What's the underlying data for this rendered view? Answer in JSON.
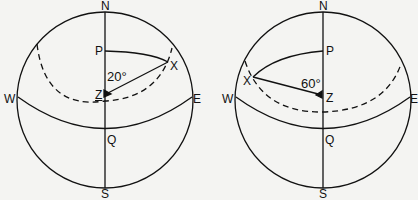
{
  "diagrams": [
    {
      "id": "left",
      "labels": {
        "N": "N",
        "S": "S",
        "W": "W",
        "E": "E",
        "P": "P",
        "Q": "Q",
        "X": "X",
        "Z": "Z"
      },
      "angle": "20°"
    },
    {
      "id": "right",
      "labels": {
        "N": "N",
        "S": "S",
        "W": "W",
        "E": "E",
        "P": "P",
        "Q": "Q",
        "X": "X",
        "Z": "Z"
      },
      "angle": "60°"
    }
  ],
  "colors": {
    "stroke": "#111111",
    "background": "#f4f4f2"
  }
}
